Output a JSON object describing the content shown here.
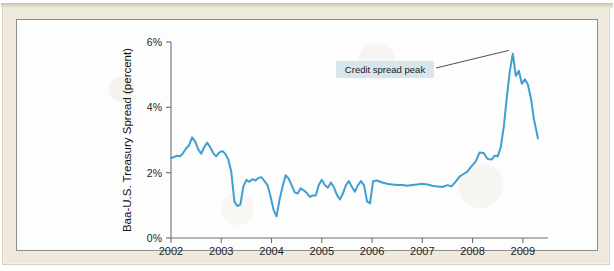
{
  "scan": {
    "top_text": ""
  },
  "figure": {
    "annotation": {
      "label": "Credit spread peak",
      "box_color": "#d7e6ec"
    }
  },
  "chart_data": {
    "type": "line",
    "title": "",
    "xlabel": "",
    "ylabel": "Baa-U.S. Treasury Spread (percent)",
    "xlim": [
      2002.0,
      2009.5
    ],
    "ylim": [
      0,
      6
    ],
    "grid": false,
    "legend": null,
    "line_color": "#3f9fd4",
    "line_width": 2.0,
    "xticks": [
      2002,
      2003,
      2004,
      2005,
      2006,
      2007,
      2008,
      2009
    ],
    "xtick_labels": [
      "2002",
      "2003",
      "2004",
      "2005",
      "2006",
      "2007",
      "2008",
      "2009"
    ],
    "yticks": [
      0,
      2,
      4,
      6
    ],
    "ytick_labels": [
      "0%",
      "2%",
      "4%",
      "6%"
    ],
    "annotations": [
      {
        "text": "Credit spread peak",
        "x": 2008.72,
        "y": 5.65,
        "note": "leader line points to the late-2008 maximum of the series"
      }
    ],
    "series": [
      {
        "name": "Baa-U.S. Treasury Spread",
        "x": [
          2002.0,
          2002.06,
          2002.12,
          2002.18,
          2002.24,
          2002.3,
          2002.36,
          2002.42,
          2002.48,
          2002.54,
          2002.6,
          2002.66,
          2002.72,
          2002.78,
          2002.84,
          2002.9,
          2002.96,
          2003.02,
          2003.08,
          2003.14,
          2003.2,
          2003.26,
          2003.32,
          2003.38,
          2003.44,
          2003.5,
          2003.56,
          2003.62,
          2003.68,
          2003.74,
          2003.8,
          2003.86,
          2003.92,
          2003.98,
          2004.04,
          2004.1,
          2004.16,
          2004.22,
          2004.28,
          2004.34,
          2004.4,
          2004.46,
          2004.52,
          2004.58,
          2004.64,
          2004.7,
          2004.76,
          2004.82,
          2004.88,
          2004.94,
          2005.0,
          2005.06,
          2005.12,
          2005.18,
          2005.24,
          2005.3,
          2005.36,
          2005.42,
          2005.48,
          2005.54,
          2005.6,
          2005.66,
          2005.72,
          2005.78,
          2005.84,
          2005.9,
          2005.96,
          2006.02,
          2006.1,
          2006.2,
          2006.3,
          2006.4,
          2006.5,
          2006.6,
          2006.7,
          2006.8,
          2006.9,
          2007.0,
          2007.1,
          2007.2,
          2007.3,
          2007.4,
          2007.5,
          2007.58,
          2007.66,
          2007.74,
          2007.82,
          2007.9,
          2007.98,
          2008.06,
          2008.14,
          2008.22,
          2008.3,
          2008.38,
          2008.44,
          2008.5,
          2008.56,
          2008.62,
          2008.68,
          2008.74,
          2008.8,
          2008.86,
          2008.92,
          2008.98,
          2009.04,
          2009.1,
          2009.16,
          2009.22,
          2009.3
        ],
        "values": [
          2.45,
          2.48,
          2.52,
          2.5,
          2.6,
          2.74,
          2.84,
          3.08,
          2.96,
          2.72,
          2.58,
          2.78,
          2.92,
          2.78,
          2.6,
          2.5,
          2.62,
          2.66,
          2.58,
          2.4,
          2.02,
          1.12,
          0.98,
          1.02,
          1.58,
          1.78,
          1.72,
          1.8,
          1.76,
          1.84,
          1.86,
          1.74,
          1.62,
          1.28,
          0.86,
          0.66,
          1.18,
          1.58,
          1.92,
          1.82,
          1.62,
          1.4,
          1.36,
          1.52,
          1.46,
          1.38,
          1.26,
          1.3,
          1.3,
          1.62,
          1.78,
          1.62,
          1.54,
          1.7,
          1.56,
          1.32,
          1.18,
          1.36,
          1.62,
          1.74,
          1.56,
          1.42,
          1.62,
          1.74,
          1.62,
          1.12,
          1.06,
          1.74,
          1.76,
          1.7,
          1.66,
          1.64,
          1.62,
          1.62,
          1.6,
          1.62,
          1.64,
          1.66,
          1.64,
          1.6,
          1.58,
          1.56,
          1.62,
          1.58,
          1.72,
          1.88,
          1.96,
          2.04,
          2.2,
          2.34,
          2.62,
          2.6,
          2.42,
          2.4,
          2.52,
          2.5,
          2.78,
          3.4,
          4.3,
          5.1,
          5.64,
          4.96,
          5.12,
          4.72,
          4.86,
          4.7,
          4.28,
          3.64,
          3.05
        ]
      }
    ]
  }
}
